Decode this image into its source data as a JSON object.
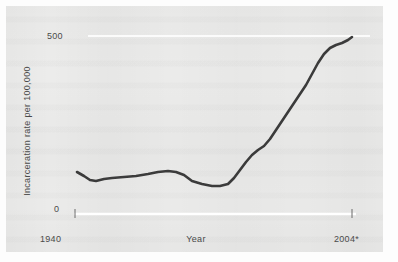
{
  "figure": {
    "panel_background": "#ececeb",
    "page_background": "#fdfdfd",
    "line_color": "#3b3b3b",
    "axis_color": "#ffffff",
    "text_color": "#4a4a4a"
  },
  "axes": {
    "y_max_label": "500",
    "y_min_label": "0",
    "y_title": "Incarceration rate per 100,000",
    "x_start_label": "1940",
    "x_end_label": "2004*",
    "x_title": "Year"
  },
  "chart_data": {
    "type": "line",
    "title": "",
    "xlabel": "Year",
    "ylabel": "Incarceration rate per 100,000",
    "xlim": [
      1940,
      2004
    ],
    "ylim": [
      0,
      500
    ],
    "grid": false,
    "legend": "none",
    "xtick_labels": [
      "1940",
      "2004*"
    ],
    "ytick_labels": [
      "0",
      "500"
    ],
    "annotations": [
      "* asterisk on final year label indicates provisional data"
    ],
    "series": [
      {
        "name": "Incarceration rate per 100,000",
        "x": [
          1940,
          1944,
          1948,
          1952,
          1956,
          1960,
          1964,
          1968,
          1972,
          1976,
          1980,
          1984,
          1988,
          1992,
          1996,
          2000,
          2004
        ],
        "y": [
          120,
          98,
          104,
          108,
          112,
          118,
          122,
          118,
          100,
          96,
          100,
          140,
          210,
          290,
          360,
          420,
          460
        ]
      }
    ],
    "pixel_path": [
      [
        77,
        172
      ],
      [
        84,
        176
      ],
      [
        90,
        180
      ],
      [
        96,
        181
      ],
      [
        104,
        179
      ],
      [
        112,
        178
      ],
      [
        124,
        177
      ],
      [
        136,
        176
      ],
      [
        148,
        174
      ],
      [
        158,
        172
      ],
      [
        168,
        171
      ],
      [
        176,
        172
      ],
      [
        184,
        175
      ],
      [
        192,
        181
      ],
      [
        202,
        184
      ],
      [
        212,
        186
      ],
      [
        220,
        186
      ],
      [
        228,
        184
      ],
      [
        234,
        178
      ],
      [
        240,
        170
      ],
      [
        246,
        162
      ],
      [
        252,
        155
      ],
      [
        258,
        150
      ],
      [
        264,
        146
      ],
      [
        270,
        139
      ],
      [
        276,
        130
      ],
      [
        282,
        121
      ],
      [
        288,
        112
      ],
      [
        294,
        103
      ],
      [
        300,
        94
      ],
      [
        306,
        85
      ],
      [
        312,
        74
      ],
      [
        318,
        63
      ],
      [
        324,
        54
      ],
      [
        330,
        48
      ],
      [
        336,
        45
      ],
      [
        342,
        43
      ],
      [
        348,
        40
      ],
      [
        352,
        37
      ]
    ]
  }
}
